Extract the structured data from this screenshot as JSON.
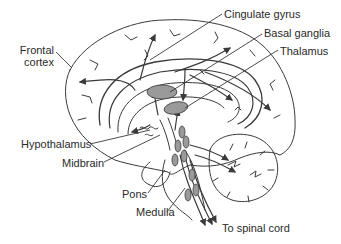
{
  "diagram": {
    "type": "brain-anatomy-sagittal",
    "colors": {
      "line": "#3a3a3a",
      "fill_structure": "#9a9a9a",
      "background": "#ffffff",
      "text": "#2a2a2a"
    },
    "labels": {
      "frontal_cortex_line1": "Frontal",
      "frontal_cortex_line2": "cortex",
      "cingulate_gyrus": "Cingulate gyrus",
      "basal_ganglia": "Basal ganglia",
      "thalamus": "Thalamus",
      "hypothalamus": "Hypothalamus",
      "midbrain": "Midbrain",
      "pons": "Pons",
      "medulla": "Medulla",
      "to_spinal_cord": "To spinal cord"
    }
  }
}
